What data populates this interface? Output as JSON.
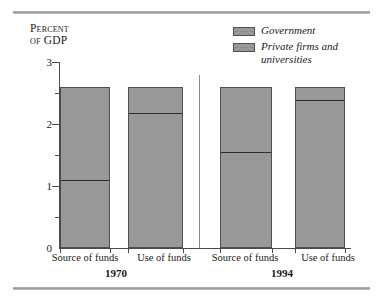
{
  "figure": {
    "y_axis_title_line1": "Percent",
    "y_axis_title_line2": "of GDP",
    "y_tick_labels": [
      "3",
      "2",
      "1",
      "0"
    ],
    "group_labels": [
      "1970",
      "1994"
    ],
    "category_labels": [
      "Source of funds",
      "Use of funds",
      "Source of funds",
      "Use of funds"
    ],
    "legend": {
      "items": [
        {
          "label": "Government",
          "label_cont": "",
          "color": "#989898"
        },
        {
          "label": "Private firms and",
          "label_cont": "universities",
          "color": "#989898"
        }
      ]
    },
    "colors": {
      "bar_fill": "#989898",
      "bar_border": "#4f4f4f",
      "divider": "#2e2e2e",
      "axis": "#4a4a4a",
      "rule": "#9a9a9a",
      "separator": "#8a8a8a",
      "background": "#ffffff"
    }
  },
  "chart_data": {
    "type": "bar",
    "stacked": true,
    "title": "",
    "subtitle": "",
    "xlabel": "",
    "ylabel": "Percent of GDP",
    "ylim": [
      0,
      3
    ],
    "ytick_values": [
      0,
      1,
      2,
      3
    ],
    "yminor_tick_values": [
      0.5,
      1.5,
      2.5
    ],
    "grid": false,
    "legend_position": "top-right",
    "groups": [
      "1970",
      "1994"
    ],
    "categories": [
      "1970 Source of funds",
      "1970 Use of funds",
      "1994 Source of funds",
      "1994 Use of funds"
    ],
    "series": [
      {
        "name": "Government",
        "values": [
          1.12,
          2.2,
          1.56,
          2.4
        ]
      },
      {
        "name": "Private firms and universities",
        "values": [
          1.48,
          0.4,
          1.04,
          0.2
        ]
      }
    ],
    "totals": [
      2.6,
      2.6,
      2.6,
      2.6
    ],
    "units": "percent of GDP"
  }
}
